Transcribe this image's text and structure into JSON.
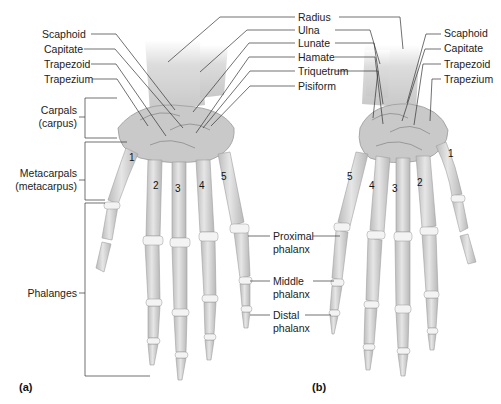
{
  "figure": {
    "panels": [
      {
        "id": "a",
        "label": "(a)"
      },
      {
        "id": "b",
        "label": "(b)"
      }
    ],
    "top_center_labels": [
      "Radius",
      "Ulna",
      "Lunate",
      "Hamate",
      "Triquetrum",
      "Pisiform"
    ],
    "left_hand_labels": [
      "Scaphoid",
      "Capitate",
      "Trapezoid",
      "Trapezium"
    ],
    "right_hand_labels": [
      "Scaphoid",
      "Capitate",
      "Trapezoid",
      "Trapezium"
    ],
    "groups": {
      "carpals": {
        "line1": "Carpals",
        "line2": "(carpus)"
      },
      "metacarpals": {
        "line1": "Metacarpals",
        "line2": "(metacarpus)"
      },
      "phalanges": {
        "line1": "Phalanges"
      }
    },
    "phalanx_labels": {
      "proximal": {
        "line1": "Proximal",
        "line2": "phalanx"
      },
      "middle": {
        "line1": "Middle",
        "line2": "phalanx"
      },
      "distal": {
        "line1": "Distal",
        "line2": "phalanx"
      }
    },
    "metacarpal_numbers_a": [
      "1",
      "2",
      "3",
      "4",
      "5"
    ],
    "metacarpal_numbers_b": [
      "5",
      "4",
      "3",
      "2",
      "1"
    ],
    "colors": {
      "bone": "#d9d9d9",
      "bone_shade": "#b5b5b5",
      "joint": "#f4f4f4",
      "line": "#333333"
    }
  }
}
